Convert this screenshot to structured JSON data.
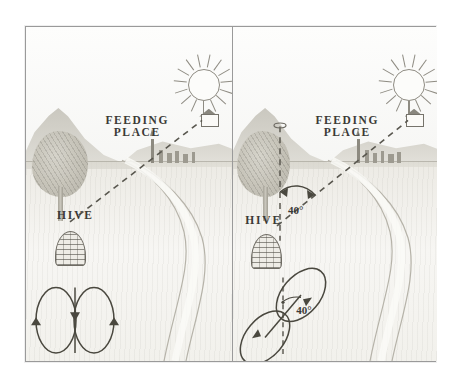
{
  "figure": {
    "panel_count": 2,
    "background_color": "#ffffff",
    "frame_color": "#9a9a9a",
    "ink_color": "#3b3a36"
  },
  "panels": [
    {
      "id": "left",
      "name": "feeding-place-in-line-with-sun",
      "labels": {
        "feeding_place": "FEEDING\nPLACE",
        "hive": "HIVE"
      },
      "scene": {
        "sun": "sun-icon",
        "village": "village-on-horizon",
        "tree": "tree",
        "hive": "skep-hive-icon",
        "feeding_house": "feeding-station-house",
        "road": "winding-road",
        "flight_path": "dashed-bee-flight-line"
      },
      "dance": {
        "type": "straight-run-figure-eight",
        "angle_deg": 0,
        "angle_label": "",
        "reference_line": "none",
        "arrows": [
          "down-left",
          "up-center",
          "down-right"
        ],
        "description": "Vertical figure-eight: waggle run points straight up"
      }
    },
    {
      "id": "right",
      "name": "feeding-place-at-40-degrees-from-sun",
      "labels": {
        "feeding_place": "FEEDING\nPLACE",
        "hive": "HIVE",
        "scene_angle": "40°",
        "dance_angle": "40°"
      },
      "scene": {
        "sun": "sun-icon",
        "village": "village-on-horizon",
        "tree": "tree",
        "hive": "skep-hive-icon",
        "feeding_house": "feeding-station-house",
        "road": "winding-road",
        "flight_path": "dashed-bee-flight-line",
        "sun_bearing_line": "vertical-dashed-sun-line",
        "angle_arc": "double-headed-arc-arrow"
      },
      "dance": {
        "type": "tilted-figure-eight",
        "angle_deg": 40,
        "angle_label": "40°",
        "reference_line": "vertical-dashed-line",
        "arrows": [
          "down-left",
          "up-right"
        ],
        "description": "Figure-eight tilted 40 degrees from vertical"
      }
    }
  ],
  "legend_values": {
    "scene_angle_deg": 40,
    "dance_angle_deg": 40,
    "degree_symbol": "°"
  }
}
